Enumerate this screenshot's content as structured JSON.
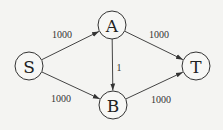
{
  "diagram": {
    "type": "directed-graph",
    "nodes": [
      {
        "id": "S",
        "label": "S",
        "cx": 29,
        "cy": 66
      },
      {
        "id": "A",
        "label": "A",
        "cx": 112,
        "cy": 25
      },
      {
        "id": "B",
        "label": "B",
        "cx": 113,
        "cy": 105
      },
      {
        "id": "T",
        "label": "T",
        "cx": 196,
        "cy": 66
      }
    ],
    "edges": [
      {
        "from": "S",
        "to": "A",
        "weight": "1000",
        "label_x": 62,
        "label_y": 34
      },
      {
        "from": "A",
        "to": "T",
        "weight": "1000",
        "label_x": 159,
        "label_y": 34
      },
      {
        "from": "A",
        "to": "B",
        "weight": "1",
        "label_x": 119,
        "label_y": 67
      },
      {
        "from": "S",
        "to": "B",
        "weight": "1000",
        "label_x": 61,
        "label_y": 98
      },
      {
        "from": "B",
        "to": "T",
        "weight": "1000",
        "label_x": 161,
        "label_y": 99
      }
    ],
    "node_radius": 14,
    "colors": {
      "background": "#f4f4f2",
      "stroke": "#333333",
      "text": "#222222"
    }
  }
}
